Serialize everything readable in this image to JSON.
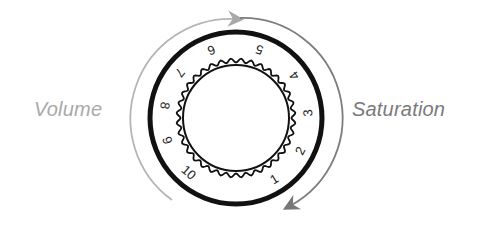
{
  "labels": {
    "left": "Volume",
    "right": "Saturation"
  },
  "dial": {
    "center": [
      236,
      118
    ],
    "numerals": [
      "1",
      "2",
      "3",
      "4",
      "5",
      "6",
      "7",
      "8",
      "9",
      "10"
    ],
    "numeral_angles_deg": [
      58,
      27,
      -4,
      -36,
      -71,
      -110,
      -141,
      -170,
      162,
      131
    ],
    "numeral_radius": 72,
    "gear_teeth": 36
  },
  "colors": {
    "ring": "#111111",
    "left_arrow": "#b5b5b5",
    "right_arrow": "#7d7d7d",
    "left_text": "#a9a9a9",
    "right_text": "#7a7a7a"
  }
}
